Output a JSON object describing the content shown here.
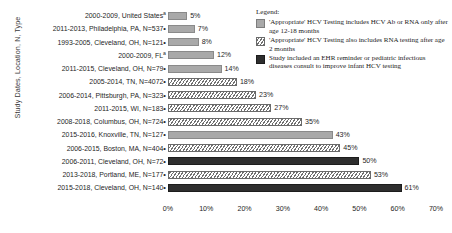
{
  "chart_data": {
    "type": "bar",
    "orientation": "horizontal",
    "title": "",
    "xlabel": "",
    "ylabel": "Study Dates, Location, N, Type",
    "xlim": [
      0,
      70
    ],
    "xticks": [
      "0%",
      "10%",
      "20%",
      "30%",
      "40%",
      "50%",
      "60%",
      "70%"
    ],
    "xtick_values": [
      0,
      10,
      20,
      30,
      40,
      50,
      60,
      70
    ],
    "grid": false,
    "legend_position": "top-right",
    "categories": [
      "2000-2009, United States",
      "2011-2013, Philadelphia, PA, N=537",
      "1993-2005, Cleveland, OH, N=121",
      "2000-2009, FL",
      "2011-2015, Cleveland, OH, N=79",
      "2005-2014, TN, N=4072",
      "2006-2014, Pittsburgh, PA, N=323",
      "2011-2015, WI, N=183",
      "2008-2018, Columbus, OH, N=724",
      "2015-2016, Knoxville, TN, N=127",
      "2006-2015, Boston, MA, N=404",
      "2006-2011, Cleveland, OH, N=72",
      "2013-2018, Portland, ME, N=177",
      "2015-2018, Cleveland, OH, N=140"
    ],
    "values": [
      5,
      7,
      8,
      12,
      14,
      18,
      23,
      27,
      35,
      43,
      45,
      50,
      53,
      61
    ],
    "value_labels": [
      "5%",
      "7%",
      "8%",
      "12%",
      "14%",
      "18%",
      "23%",
      "27%",
      "35%",
      "43%",
      "45%",
      "50%",
      "53%",
      "61%"
    ],
    "markers": [
      "a",
      "•",
      "•",
      "a",
      "•",
      "•",
      "•",
      "•",
      "•",
      "•",
      "•",
      "•",
      "•",
      "•"
    ],
    "patterns": [
      "solid-light",
      "solid-light",
      "solid-light",
      "solid-light",
      "solid-light",
      "hatch",
      "hatch",
      "hatch",
      "hatch",
      "solid-light",
      "hatch",
      "solid-dark",
      "hatch",
      "solid-dark"
    ],
    "colors": {
      "solid-light": "#a9a9a9",
      "hatch": "#6f6f6f",
      "solid-dark": "#2e2e2e"
    }
  },
  "legend": {
    "title": "Legend:",
    "items": [
      {
        "pattern": "solid-light",
        "text": "'Appropriate' HCV Testing includes HCV Ab or RNA only after age 12-18 months"
      },
      {
        "pattern": "hatch",
        "text": "'Appropriate' HCV Testing also includes RNA testing after age 2 months"
      },
      {
        "pattern": "solid-dark",
        "text": "Study included an EHR reminder or pediatric infectious diseases consult to improve infant HCV testing"
      }
    ]
  }
}
